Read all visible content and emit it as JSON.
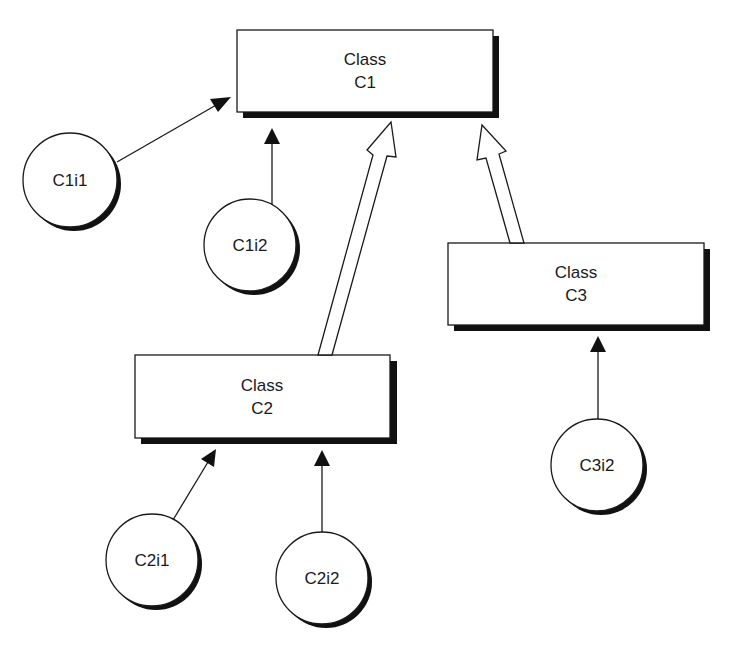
{
  "diagram": {
    "classes": [
      {
        "id": "C1",
        "line1": "Class",
        "line2": "C1"
      },
      {
        "id": "C2",
        "line1": "Class",
        "line2": "C2"
      },
      {
        "id": "C3",
        "line1": "Class",
        "line2": "C3"
      }
    ],
    "instances": [
      {
        "id": "C1i1",
        "label": "C1i1",
        "of": "C1"
      },
      {
        "id": "C1i2",
        "label": "C1i2",
        "of": "C1"
      },
      {
        "id": "C2i1",
        "label": "C2i1",
        "of": "C2"
      },
      {
        "id": "C2i2",
        "label": "C2i2",
        "of": "C2"
      },
      {
        "id": "C3i2",
        "label": "C3i2",
        "of": "C3"
      }
    ],
    "inheritance": [
      {
        "from": "C2",
        "to": "C1"
      },
      {
        "from": "C3",
        "to": "C1"
      }
    ],
    "colors": {
      "stroke": "#1a1a1a",
      "shadow": "#111111",
      "fill": "#ffffff"
    }
  }
}
